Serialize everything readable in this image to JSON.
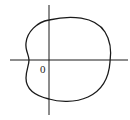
{
  "diagram": {
    "type": "polar-curve",
    "origin_label": "0",
    "stroke_color": "#1a1a1a",
    "background": "#ffffff"
  }
}
